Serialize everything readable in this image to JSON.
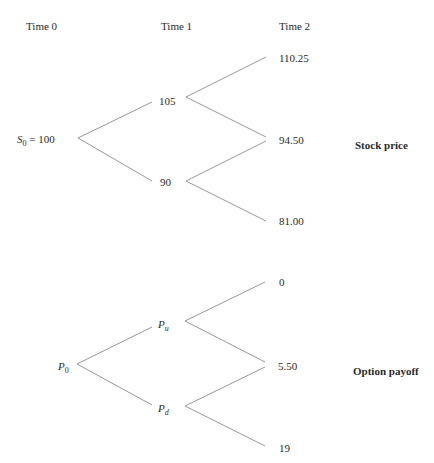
{
  "headers": {
    "time0": "Time 0",
    "time1": "Time 1",
    "time2": "Time 2"
  },
  "stock_tree": {
    "title": "Stock price",
    "root": {
      "symbol": "S",
      "subscript": "0",
      "value": "= 100"
    },
    "time1": {
      "up": "105",
      "down": "90"
    },
    "time2": {
      "uu": "110.25",
      "ud": "94.50",
      "dd": "81.00"
    }
  },
  "option_tree": {
    "title": "Option payoff",
    "root": {
      "symbol": "P",
      "subscript": "0"
    },
    "time1": {
      "up_symbol": "P",
      "up_subscript": "u",
      "down_symbol": "P",
      "down_subscript": "d"
    },
    "time2": {
      "uu": "0",
      "ud": "5.50",
      "dd": "19"
    }
  },
  "colors": {
    "line": "#8a8a8a",
    "text": "#2a2a2a"
  }
}
